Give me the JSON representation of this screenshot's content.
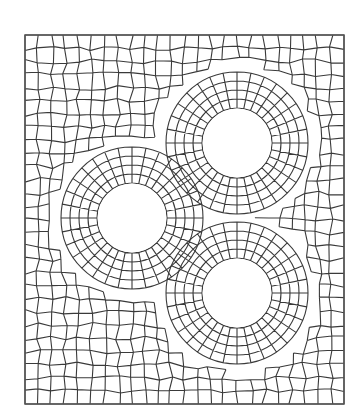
{
  "diagram": {
    "type": "quadrilateral-finite-element-mesh",
    "background": "#ffffff",
    "line_color": "#3a3a3a",
    "border_color": "#555555",
    "plate": {
      "x": 25,
      "y": 35,
      "width": 319,
      "height": 369
    },
    "holes": [
      {
        "id": "hole-top-right",
        "cx": 237,
        "cy": 143,
        "r": 35
      },
      {
        "id": "hole-left",
        "cx": 132,
        "cy": 218,
        "r": 35
      },
      {
        "id": "hole-bottom-right",
        "cx": 237,
        "cy": 293,
        "r": 35
      }
    ],
    "mesh": {
      "background_cols": 24,
      "background_rows": 28,
      "ring_spokes": 32,
      "ring_layers": 4,
      "ring_spacing": 9
    }
  }
}
